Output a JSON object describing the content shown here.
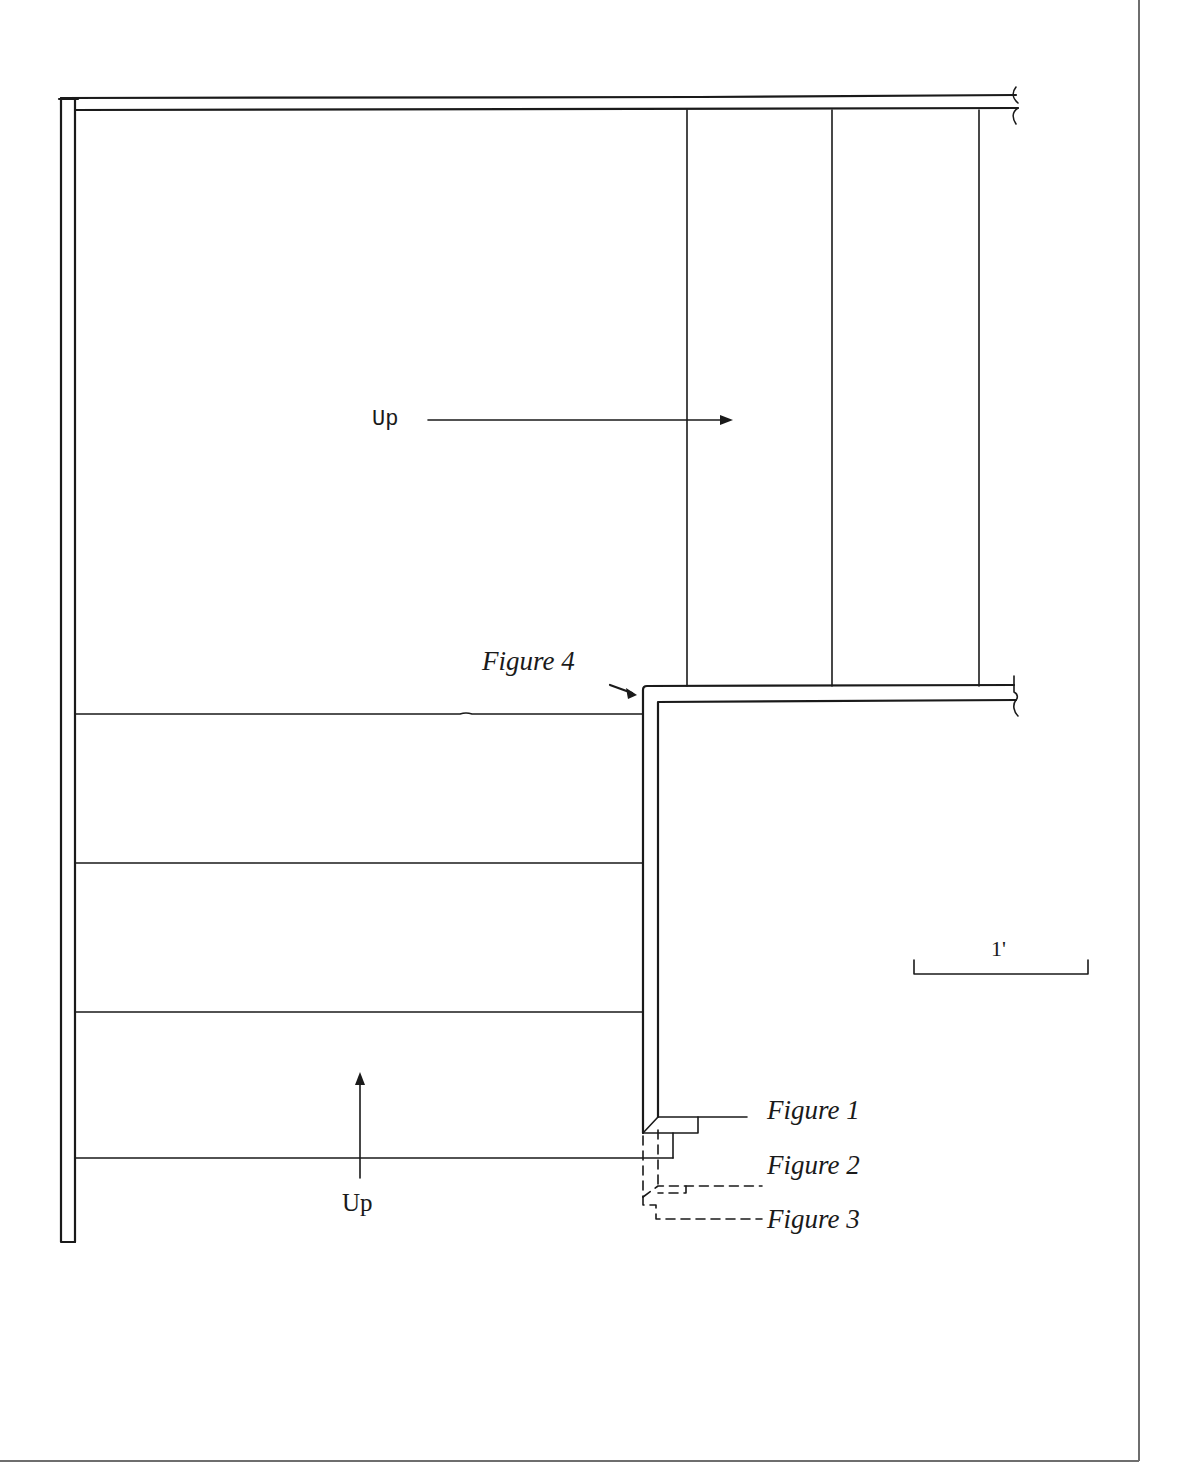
{
  "diagram": {
    "type": "stair-plan",
    "colors": {
      "ink": "#1a1a1a",
      "border": "#6e6e6e",
      "background": "#ffffff"
    },
    "labels": {
      "up_upper": "Up",
      "up_lower": "Up",
      "figure_1": "Figure 1",
      "figure_2": "Figure 2",
      "figure_3": "Figure 3",
      "figure_4": "Figure 4",
      "scale": "1'"
    },
    "lower_flight": {
      "tread_lines_y": [
        714,
        863,
        1012,
        1158
      ],
      "x_range": [
        75,
        642
      ]
    },
    "upper_flight": {
      "riser_lines_x": [
        687,
        832,
        979
      ],
      "y_range": [
        109,
        686
      ]
    }
  }
}
